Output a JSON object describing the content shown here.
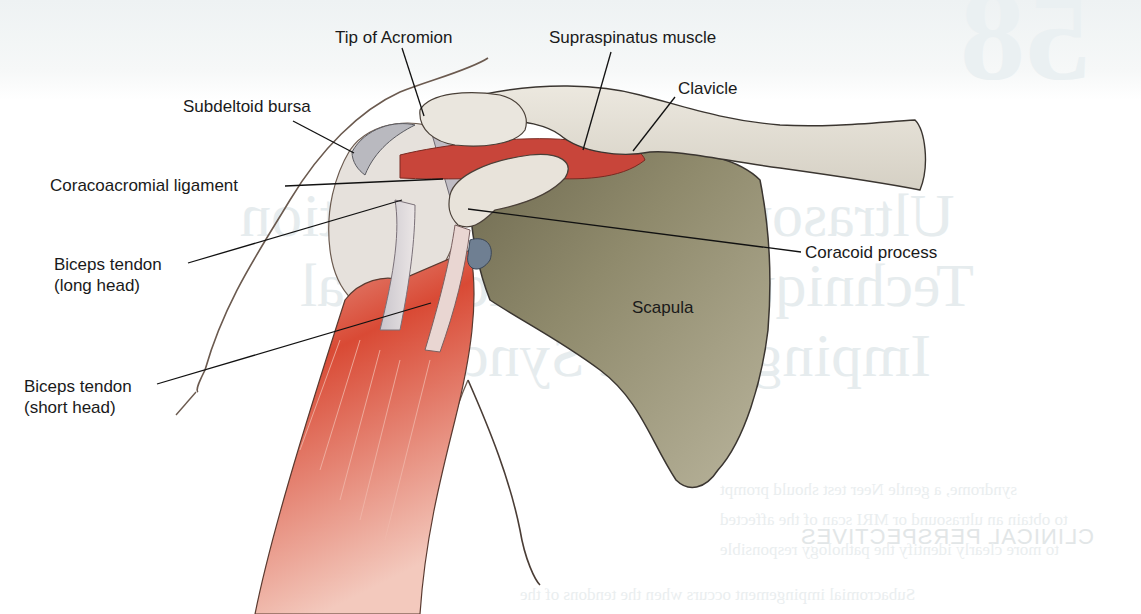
{
  "figure": {
    "type": "anatomical-illustration",
    "labels": [
      {
        "id": "tip-of-acromion",
        "text": "Tip of Acromion"
      },
      {
        "id": "supraspinatus-muscle",
        "text": "Supraspinatus muscle"
      },
      {
        "id": "clavicle",
        "text": "Clavicle"
      },
      {
        "id": "subdeltoid-bursa",
        "text": "Subdeltoid bursa"
      },
      {
        "id": "coracoacromial-ligament",
        "text": "Coracoacromial ligament"
      },
      {
        "id": "coracoid-process",
        "text": "Coracoid process"
      },
      {
        "id": "biceps-long-head",
        "line1": "Biceps tendon",
        "line2": "(long head)"
      },
      {
        "id": "scapula",
        "text": "Scapula"
      },
      {
        "id": "biceps-short-head",
        "line1": "Biceps tendon",
        "line2": "(short head)"
      }
    ],
    "colors": {
      "bone": "#e4e0d6",
      "scapula": "#8c8668",
      "muscle": "#c8382a",
      "tendon": "#d8d2d6",
      "outline": "#3a3530"
    }
  },
  "show_through": {
    "chapter_number": "58",
    "title_lines": [
      "Ultrasound-Guided Injection",
      "Technique for Subacromial",
      "Impingement Syndrome"
    ],
    "section_heading": "CLINICAL PERSPECTIVES",
    "body_lines": [
      "Subacromial impingement occurs when the tendons of the",
      "syndrome, a gentle Neer test should prompt",
      "to obtain an ultrasound or MRI scan of the affected",
      "to more clearly identify the pathology responsible"
    ]
  }
}
